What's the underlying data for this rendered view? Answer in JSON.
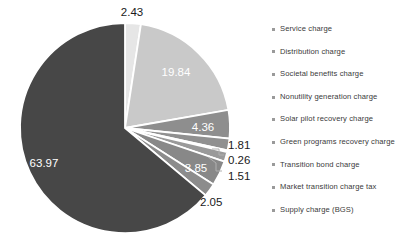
{
  "chart_data": {
    "type": "pie",
    "title": "",
    "subtitle": "",
    "xlabel": "",
    "ylabel": "",
    "grid": false,
    "legend_position": "right",
    "start_angle_deg": 0,
    "direction": "clockwise",
    "units": "percent",
    "total": 100.08,
    "categories": [
      "Service charge",
      "Distribution charge",
      "Societal benefits charge",
      "Nonutility generation charge",
      "Solar pilot recovery charge",
      "Green programs recovery charge",
      "Transition bond charge",
      "Market transition charge tax",
      "Supply charge (BGS)"
    ],
    "values": [
      2.43,
      19.84,
      4.36,
      1.81,
      0.26,
      1.51,
      3.85,
      2.05,
      63.97
    ],
    "data_labels": [
      "2.43",
      "19.84",
      "4.36",
      "1.81",
      "0.26",
      "1.51",
      "3.85",
      "2.05",
      "63.97"
    ],
    "colors": [
      "#e6e6e6",
      "#c9c9c9",
      "#8e8e8e",
      "#909090",
      "#d9d9d9",
      "#9a9a9a",
      "#888888",
      "#8c8c8c",
      "#474747"
    ],
    "slice_border_color": "#ffffff",
    "label_colors": [
      "#1a1a1a",
      "#ffffff",
      "#ffffff",
      "#1a1a1a",
      "#1a1a1a",
      "#1a1a1a",
      "#ffffff",
      "#1a1a1a",
      "#ffffff"
    ]
  },
  "legend": {
    "marker_color": "#9a9a9a",
    "items": [
      {
        "label": "Service charge"
      },
      {
        "label": "Distribution charge"
      },
      {
        "label": "Societal benefits charge"
      },
      {
        "label": "Nonutility generation charge"
      },
      {
        "label": "Solar pilot recovery charge"
      },
      {
        "label": "Green programs recovery charge"
      },
      {
        "label": "Transition bond charge"
      },
      {
        "label": "Market transition charge tax"
      },
      {
        "label": "Supply charge (BGS)"
      }
    ]
  },
  "labels": {
    "v0": "2.43",
    "v1": "19.84",
    "v2": "4.36",
    "v3": "1.81",
    "v4": "0.26",
    "v5": "1.51",
    "v6": "3.85",
    "v7": "2.05",
    "v8": "63.97"
  }
}
